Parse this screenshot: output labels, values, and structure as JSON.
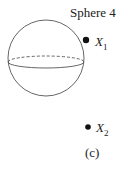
{
  "title": "Sphere 4",
  "points": [
    {
      "label": "X",
      "subscript": "1"
    },
    {
      "label": "X",
      "subscript": "2"
    }
  ],
  "caption": "(c)",
  "colors": {
    "stroke": "#555555",
    "point": "#111111"
  }
}
